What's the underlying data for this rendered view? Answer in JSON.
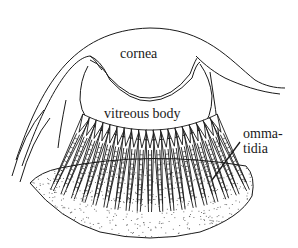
{
  "diagram": {
    "labels": {
      "cornea": "cornea",
      "vitreous_body": "vitreous body",
      "ommatidia_line1": "omma-",
      "ommatidia_line2": "tidia"
    },
    "colors": {
      "stroke": "#1a1a1a",
      "background": "#ffffff",
      "stipple": "#555555"
    },
    "ommatidia_count": 19
  }
}
